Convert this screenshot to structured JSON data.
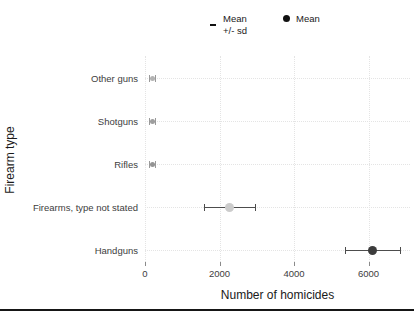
{
  "chart_data": {
    "type": "scatter",
    "title": "",
    "xlabel": "Number of homicides",
    "ylabel": "Firearm type",
    "xlim": [
      0,
      7100
    ],
    "xticks": [
      0,
      2000,
      4000,
      6000
    ],
    "grid": true,
    "categories": [
      "Other guns",
      "Shotguns",
      "Rifles",
      "Firearms, type not stated",
      "Handguns"
    ],
    "series": [
      {
        "name": "Mean",
        "values": [
          200,
          200,
          200,
          2280,
          6120
        ],
        "sd": [
          90,
          80,
          90,
          680,
          730
        ],
        "point_colors": [
          "#b3b3b3",
          "#9e9e9e",
          "#949494",
          "#cccccc",
          "#3c3c3c"
        ],
        "bar_colors": [
          "#9a9a9a",
          "#9a9a9a",
          "#9a9a9a",
          "#4d4d4d",
          "#4d4d4d"
        ]
      }
    ],
    "legend": {
      "position": "top",
      "items": [
        {
          "symbol": "errorbar-dash",
          "lines": [
            "Mean",
            "+/- sd"
          ]
        },
        {
          "symbol": "filled-circle",
          "lines": [
            "Mean"
          ]
        }
      ]
    }
  }
}
